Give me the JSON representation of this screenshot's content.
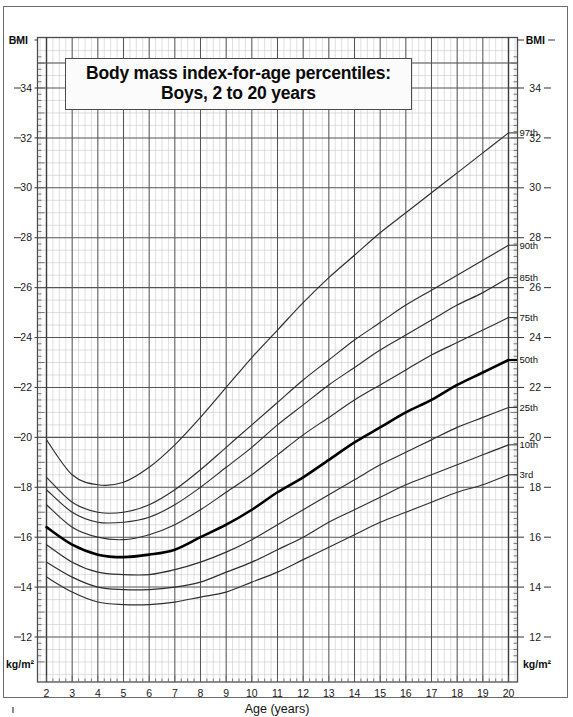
{
  "title": {
    "line1": "Body mass index-for-age percentiles:",
    "line2": "Boys, 2 to 20 years"
  },
  "axes": {
    "x_axis_title": "Age (years)",
    "y_top_left_label": "BMI",
    "y_top_right_label": "BMI",
    "y_bottom_left_label": "kg/m²",
    "y_bottom_right_label": "kg/m²",
    "x_ticks": [
      "2",
      "3",
      "4",
      "5",
      "6",
      "7",
      "8",
      "9",
      "10",
      "11",
      "12",
      "13",
      "14",
      "15",
      "16",
      "17",
      "18",
      "19",
      "20"
    ],
    "y_ticks": [
      "12",
      "14",
      "16",
      "18",
      "20",
      "22",
      "24",
      "26",
      "28",
      "30",
      "32",
      "34"
    ]
  },
  "colors": {
    "grid_major": "#555555",
    "grid_minor": "#c9c9c9",
    "curve": "#2e2e2e",
    "curve_bold": "#000000",
    "frame": "#4d4d4d",
    "text": "#111111",
    "background": "#ffffff"
  },
  "chart_data": {
    "type": "line",
    "title": "Body mass index-for-age percentiles: Boys, 2 to 20 years",
    "xlabel": "Age (years)",
    "ylabel": "BMI (kg/m²)",
    "xlim": [
      2,
      20
    ],
    "ylim": [
      11,
      35.4
    ],
    "grid": true,
    "legend": "curve-end labels at right",
    "x": [
      2,
      3,
      4,
      5,
      6,
      7,
      8,
      9,
      10,
      11,
      12,
      13,
      14,
      15,
      16,
      17,
      18,
      19,
      20
    ],
    "series": [
      {
        "name": "97th",
        "label": "97th",
        "bold": false,
        "values": [
          19.9,
          18.5,
          18.1,
          18.2,
          18.8,
          19.7,
          20.8,
          22.0,
          23.2,
          24.3,
          25.4,
          26.4,
          27.3,
          28.2,
          29.0,
          29.8,
          30.6,
          31.4,
          32.2
        ]
      },
      {
        "name": "90th",
        "label": "90th",
        "bold": false,
        "values": [
          18.4,
          17.4,
          17.0,
          17.0,
          17.3,
          17.9,
          18.7,
          19.6,
          20.5,
          21.4,
          22.3,
          23.1,
          23.9,
          24.6,
          25.3,
          25.9,
          26.5,
          27.1,
          27.7
        ]
      },
      {
        "name": "85th",
        "label": "85th",
        "bold": false,
        "values": [
          17.9,
          17.0,
          16.6,
          16.6,
          16.8,
          17.3,
          18.0,
          18.8,
          19.6,
          20.5,
          21.3,
          22.1,
          22.8,
          23.5,
          24.1,
          24.7,
          25.3,
          25.8,
          26.4
        ]
      },
      {
        "name": "75th",
        "label": "75th",
        "bold": false,
        "values": [
          17.3,
          16.4,
          16.0,
          15.9,
          16.1,
          16.5,
          17.1,
          17.8,
          18.5,
          19.3,
          20.1,
          20.8,
          21.5,
          22.1,
          22.7,
          23.3,
          23.8,
          24.3,
          24.8
        ]
      },
      {
        "name": "50th",
        "label": "50th",
        "bold": true,
        "values": [
          16.4,
          15.7,
          15.3,
          15.2,
          15.3,
          15.5,
          16.0,
          16.5,
          17.1,
          17.8,
          18.4,
          19.1,
          19.8,
          20.4,
          21.0,
          21.5,
          22.1,
          22.6,
          23.1
        ]
      },
      {
        "name": "25th",
        "label": "25th",
        "bold": false,
        "values": [
          15.7,
          15.0,
          14.6,
          14.5,
          14.5,
          14.7,
          15.0,
          15.4,
          15.9,
          16.5,
          17.1,
          17.7,
          18.3,
          18.9,
          19.4,
          19.9,
          20.4,
          20.8,
          21.2
        ]
      },
      {
        "name": "10th",
        "label": "10th",
        "bold": false,
        "values": [
          15.0,
          14.4,
          14.0,
          13.9,
          13.9,
          14.0,
          14.2,
          14.6,
          15.0,
          15.5,
          16.0,
          16.6,
          17.1,
          17.6,
          18.1,
          18.5,
          18.9,
          19.3,
          19.7
        ]
      },
      {
        "name": "3rd",
        "label": "3rd",
        "bold": false,
        "values": [
          14.4,
          13.8,
          13.4,
          13.3,
          13.3,
          13.4,
          13.6,
          13.8,
          14.2,
          14.6,
          15.1,
          15.6,
          16.1,
          16.6,
          17.0,
          17.4,
          17.8,
          18.1,
          18.5
        ]
      }
    ]
  }
}
